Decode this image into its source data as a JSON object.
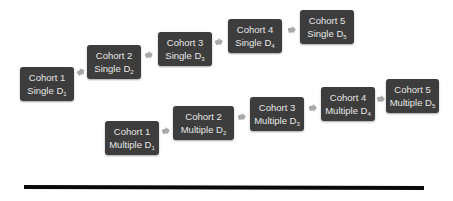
{
  "diagram": {
    "single_row": [
      {
        "line1": "Cohort 1",
        "line2": "Single D",
        "sub": "1"
      },
      {
        "line1": "Cohort 2",
        "line2": "Single D",
        "sub": "2"
      },
      {
        "line1": "Cohort 3",
        "line2": "Single D",
        "sub": "3"
      },
      {
        "line1": "Cohort 4",
        "line2": "Single D",
        "sub": "4"
      },
      {
        "line1": "Cohort 5",
        "line2": "Single D",
        "sub": "5"
      }
    ],
    "multiple_row": [
      {
        "line1": "Cohort 1",
        "line2": "Multiple D",
        "sub": "1"
      },
      {
        "line1": "Cohort 2",
        "line2": "Multiple D",
        "sub": "2"
      },
      {
        "line1": "Cohort 3",
        "line2": "Multiple D",
        "sub": "3"
      },
      {
        "line1": "Cohort 4",
        "line2": "Multiple D",
        "sub": "4"
      },
      {
        "line1": "Cohort 5",
        "line2": "Multiple D",
        "sub": "5"
      }
    ],
    "colors": {
      "box": "#3d3d3d",
      "text": "#e6e6e6",
      "arrow": "#a9a9a9",
      "rule": "#0a0a0a"
    }
  }
}
